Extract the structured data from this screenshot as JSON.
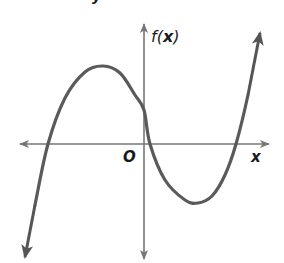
{
  "chart_data": {
    "type": "line",
    "title": "",
    "xlabel": "x",
    "ylabel": "f(x)",
    "origin_label": "O",
    "grid": false,
    "ticks": false,
    "end_behavior": {
      "left": "down",
      "right": "up"
    },
    "features": {
      "zeros_approx_px": [
        48,
        150,
        236
      ],
      "relative_max_px": [
        103,
        66
      ],
      "relative_min_px": [
        198,
        203
      ],
      "y_intercept_px": [
        144,
        110
      ]
    },
    "curve_points_px": [
      [
        25,
        257
      ],
      [
        35,
        205
      ],
      [
        48,
        144
      ],
      [
        65,
        98
      ],
      [
        85,
        72
      ],
      [
        103,
        66
      ],
      [
        120,
        73
      ],
      [
        135,
        95
      ],
      [
        144,
        110
      ],
      [
        150,
        144
      ],
      [
        165,
        180
      ],
      [
        185,
        200
      ],
      [
        198,
        203
      ],
      [
        212,
        196
      ],
      [
        225,
        175
      ],
      [
        236,
        144
      ],
      [
        248,
        95
      ],
      [
        260,
        33
      ]
    ],
    "colors": {
      "curve": "#5a5a5a",
      "axes": "#777777",
      "text": "#1a1a1a"
    }
  },
  "labels": {
    "y_axis": "f(x)",
    "y_axis_func": "f",
    "y_axis_open": "(",
    "y_axis_var": "x",
    "y_axis_close": ")",
    "x_axis": "x",
    "origin": "O",
    "top_fragment": "y"
  }
}
